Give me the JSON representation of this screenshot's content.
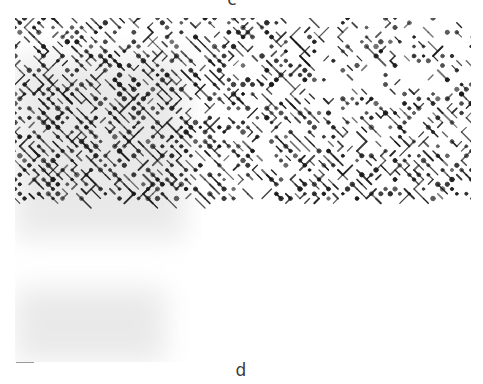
{
  "figure": {
    "panels": [
      {
        "label": "c",
        "position": "top-center",
        "truncated": true
      },
      {
        "label": "d",
        "position": "bottom-center"
      }
    ],
    "image": {
      "description": "Grayscale micrograph showing a diagonal lattice of dark dots and short linked segments on a white background",
      "pattern_angle_deg": 45,
      "dot_color": "#1a1a1a",
      "background_color": "#ffffff",
      "shaded_region_color": "#d8d8d8",
      "lattice_spacing_px": 9.5,
      "shaded_regions": [
        {
          "name": "upper-left",
          "x": 0,
          "y": 40,
          "w": 170,
          "h": 180
        },
        {
          "name": "lower-left",
          "x": 0,
          "y": 270,
          "w": 150,
          "h": 74
        }
      ]
    }
  }
}
